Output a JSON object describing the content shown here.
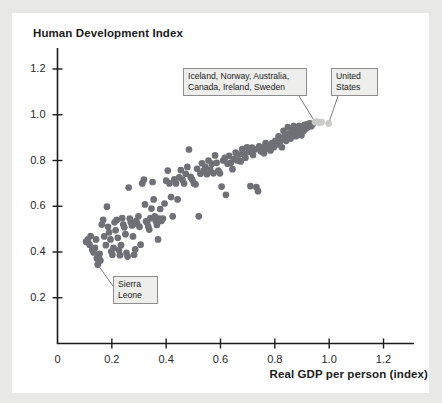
{
  "chart_data": {
    "type": "scatter",
    "title": "Human Development Index",
    "ylabel": "Human Development Index",
    "xlabel": "Real GDP per person (index)",
    "xlim": [
      0,
      1.3
    ],
    "ylim": [
      0,
      1.3
    ],
    "grid": false,
    "legend": "none",
    "xticks": [
      "0",
      "0.2",
      "0.4",
      "0.6",
      "0.8",
      "1.0",
      "1.2"
    ],
    "xtick_values": [
      0,
      0.2,
      0.4,
      0.6,
      0.8,
      1.0,
      1.2
    ],
    "yticks": [
      "0.2",
      "0.4",
      "0.6",
      "0.8",
      "1.0",
      "1.2"
    ],
    "ytick_values": [
      0.2,
      0.4,
      0.6,
      0.8,
      1.0,
      1.2
    ],
    "marker_color": "#6f7076",
    "highlight_color": "#c9c9c7",
    "series": [
      {
        "name": "Countries",
        "color": "#6f7076",
        "points": [
          [
            0.105,
            0.445
          ],
          [
            0.112,
            0.455
          ],
          [
            0.118,
            0.432
          ],
          [
            0.122,
            0.47
          ],
          [
            0.128,
            0.41
          ],
          [
            0.133,
            0.398
          ],
          [
            0.138,
            0.418
          ],
          [
            0.142,
            0.455
          ],
          [
            0.145,
            0.372
          ],
          [
            0.148,
            0.345
          ],
          [
            0.152,
            0.38
          ],
          [
            0.155,
            0.392
          ],
          [
            0.158,
            0.363
          ],
          [
            0.163,
            0.52
          ],
          [
            0.168,
            0.54
          ],
          [
            0.172,
            0.468
          ],
          [
            0.178,
            0.43
          ],
          [
            0.182,
            0.598
          ],
          [
            0.186,
            0.51
          ],
          [
            0.19,
            0.486
          ],
          [
            0.195,
            0.455
          ],
          [
            0.198,
            0.402
          ],
          [
            0.202,
            0.388
          ],
          [
            0.206,
            0.418
          ],
          [
            0.21,
            0.53
          ],
          [
            0.214,
            0.495
          ],
          [
            0.218,
            0.54
          ],
          [
            0.222,
            0.462
          ],
          [
            0.226,
            0.408
          ],
          [
            0.23,
            0.386
          ],
          [
            0.234,
            0.43
          ],
          [
            0.238,
            0.548
          ],
          [
            0.242,
            0.52
          ],
          [
            0.246,
            0.508
          ],
          [
            0.25,
            0.478
          ],
          [
            0.254,
            0.396
          ],
          [
            0.258,
            0.38
          ],
          [
            0.262,
            0.682
          ],
          [
            0.266,
            0.546
          ],
          [
            0.27,
            0.53
          ],
          [
            0.274,
            0.516
          ],
          [
            0.278,
            0.468
          ],
          [
            0.282,
            0.388
          ],
          [
            0.286,
            0.412
          ],
          [
            0.29,
            0.536
          ],
          [
            0.294,
            0.522
          ],
          [
            0.298,
            0.556
          ],
          [
            0.302,
            0.51
          ],
          [
            0.306,
            0.432
          ],
          [
            0.312,
            0.7
          ],
          [
            0.318,
            0.716
          ],
          [
            0.322,
            0.608
          ],
          [
            0.326,
            0.534
          ],
          [
            0.33,
            0.528
          ],
          [
            0.334,
            0.512
          ],
          [
            0.338,
            0.498
          ],
          [
            0.342,
            0.548
          ],
          [
            0.346,
            0.59
          ],
          [
            0.35,
            0.706
          ],
          [
            0.354,
            0.63
          ],
          [
            0.358,
            0.556
          ],
          [
            0.362,
            0.536
          ],
          [
            0.366,
            0.518
          ],
          [
            0.37,
            0.455
          ],
          [
            0.374,
            0.546
          ],
          [
            0.378,
            0.588
          ],
          [
            0.382,
            0.536
          ],
          [
            0.388,
            0.546
          ],
          [
            0.394,
            0.612
          ],
          [
            0.4,
            0.712
          ],
          [
            0.406,
            0.756
          ],
          [
            0.412,
            0.7
          ],
          [
            0.418,
            0.64
          ],
          [
            0.424,
            0.556
          ],
          [
            0.43,
            0.718
          ],
          [
            0.436,
            0.7
          ],
          [
            0.442,
            0.63
          ],
          [
            0.448,
            0.726
          ],
          [
            0.454,
            0.758
          ],
          [
            0.46,
            0.716
          ],
          [
            0.466,
            0.7
          ],
          [
            0.472,
            0.742
          ],
          [
            0.478,
            0.772
          ],
          [
            0.484,
            0.848
          ],
          [
            0.49,
            0.728
          ],
          [
            0.496,
            0.716
          ],
          [
            0.502,
            0.7
          ],
          [
            0.508,
            0.696
          ],
          [
            0.514,
            0.764
          ],
          [
            0.52,
            0.556
          ],
          [
            0.526,
            0.742
          ],
          [
            0.532,
            0.788
          ],
          [
            0.538,
            0.756
          ],
          [
            0.544,
            0.772
          ],
          [
            0.55,
            0.74
          ],
          [
            0.556,
            0.8
          ],
          [
            0.562,
            0.76
          ],
          [
            0.568,
            0.786
          ],
          [
            0.574,
            0.744
          ],
          [
            0.58,
            0.822
          ],
          [
            0.586,
            0.79
          ],
          [
            0.592,
            0.756
          ],
          [
            0.598,
            0.744
          ],
          [
            0.604,
            0.686
          ],
          [
            0.61,
            0.8
          ],
          [
            0.616,
            0.812
          ],
          [
            0.62,
            0.65
          ],
          [
            0.626,
            0.786
          ],
          [
            0.632,
            0.82
          ],
          [
            0.638,
            0.79
          ],
          [
            0.644,
            0.762
          ],
          [
            0.65,
            0.806
          ],
          [
            0.656,
            0.834
          ],
          [
            0.662,
            0.8
          ],
          [
            0.668,
            0.826
          ],
          [
            0.674,
            0.796
          ],
          [
            0.68,
            0.85
          ],
          [
            0.686,
            0.828
          ],
          [
            0.692,
            0.812
          ],
          [
            0.698,
            0.858
          ],
          [
            0.704,
            0.838
          ],
          [
            0.71,
            0.688
          ],
          [
            0.716,
            0.856
          ],
          [
            0.72,
            0.824
          ],
          [
            0.726,
            0.848
          ],
          [
            0.732,
            0.684
          ],
          [
            0.738,
            0.666
          ],
          [
            0.742,
            0.862
          ],
          [
            0.748,
            0.84
          ],
          [
            0.754,
            0.858
          ],
          [
            0.76,
            0.832
          ],
          [
            0.766,
            0.876
          ],
          [
            0.772,
            0.852
          ],
          [
            0.778,
            0.866
          ],
          [
            0.784,
            0.844
          ],
          [
            0.79,
            0.876
          ],
          [
            0.796,
            0.858
          ],
          [
            0.802,
            0.886
          ],
          [
            0.808,
            0.87
          ],
          [
            0.814,
            0.906
          ],
          [
            0.82,
            0.884
          ],
          [
            0.826,
            0.858
          ],
          [
            0.832,
            0.93
          ],
          [
            0.836,
            0.906
          ],
          [
            0.842,
            0.886
          ],
          [
            0.848,
            0.946
          ],
          [
            0.852,
            0.918
          ],
          [
            0.858,
            0.896
          ],
          [
            0.862,
            0.938
          ],
          [
            0.866,
            0.912
          ],
          [
            0.87,
            0.95
          ],
          [
            0.874,
            0.926
          ],
          [
            0.878,
            0.906
          ],
          [
            0.882,
            0.944
          ],
          [
            0.886,
            0.922
          ],
          [
            0.89,
            0.952
          ],
          [
            0.894,
            0.934
          ],
          [
            0.898,
            0.91
          ],
          [
            0.902,
            0.948
          ],
          [
            0.906,
            0.93
          ],
          [
            0.91,
            0.956
          ],
          [
            0.914,
            0.94
          ],
          [
            0.918,
            0.958
          ],
          [
            0.922,
            0.946
          ],
          [
            0.928,
            0.962
          ],
          [
            0.934,
            0.95
          ],
          [
            0.94,
            0.96
          ]
        ]
      },
      {
        "name": "Iceland, Norway, Australia, Canada, Ireland, Sweden",
        "color": "#c9c9c7",
        "points": [
          [
            0.948,
            0.968
          ],
          [
            0.956,
            0.97
          ],
          [
            0.964,
            0.966
          ],
          [
            0.972,
            0.968
          ]
        ]
      },
      {
        "name": "United States",
        "color": "#c9c9c7",
        "points": [
          [
            0.998,
            0.962
          ]
        ]
      }
    ],
    "annotations": [
      {
        "id": "top-cluster",
        "text": "Iceland, Norway, Australia,\nCanada, Ireland, Sweden",
        "target": [
          0.948,
          0.968
        ]
      },
      {
        "id": "united-states",
        "text": "United\nStates",
        "target": [
          0.998,
          0.962
        ]
      },
      {
        "id": "sierra-leone",
        "text": "Sierra\nLeone",
        "target": [
          0.148,
          0.345
        ]
      }
    ]
  },
  "annotations": {
    "cluster_label": "Iceland, Norway, Australia,\nCanada, Ireland, Sweden",
    "us_label": "United\nStates",
    "sierra_label": "Sierra\nLeone"
  },
  "axes": {
    "y_title": "Human Development Index",
    "x_title": "Real GDP per person (index)"
  }
}
